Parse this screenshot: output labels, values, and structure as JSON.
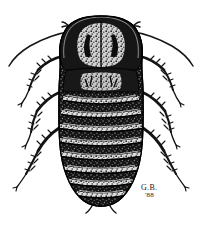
{
  "figure": {
    "kind": "scientific-illustration",
    "view": "dorsal",
    "medium": "black-and-white stipple / scratchboard pen drawing",
    "background_color": "#ffffff",
    "ink_color": "#111111",
    "canvas": {
      "width": 202,
      "height": 226
    }
  },
  "signature": {
    "initials": "G.B.",
    "year": "'88",
    "position": "lower-right",
    "color": "#1a1a1a"
  },
  "anatomy": {
    "parts": [
      {
        "name": "antenna-left",
        "label": "Left antenna"
      },
      {
        "name": "antenna-right",
        "label": "Right antenna"
      },
      {
        "name": "pronotum",
        "label": "Pronotum"
      },
      {
        "name": "mesonotum",
        "label": "Mesonotum"
      },
      {
        "name": "abdomen",
        "label": "Abdomen"
      },
      {
        "name": "leg-front-left",
        "label": "Front left leg"
      },
      {
        "name": "leg-front-right",
        "label": "Front right leg"
      },
      {
        "name": "leg-middle-left",
        "label": "Middle left leg"
      },
      {
        "name": "leg-middle-right",
        "label": "Middle right leg"
      },
      {
        "name": "leg-hind-left",
        "label": "Hind left leg"
      },
      {
        "name": "leg-hind-right",
        "label": "Hind right leg"
      },
      {
        "name": "cerci",
        "label": "Cerci"
      }
    ],
    "abdominal_segment_count": 8,
    "segment_bands": [
      {
        "index": 1,
        "y": 96,
        "half_width": 38,
        "sag": 7
      },
      {
        "index": 2,
        "y": 110,
        "half_width": 40,
        "sag": 7
      },
      {
        "index": 3,
        "y": 124,
        "half_width": 41,
        "sag": 7
      },
      {
        "index": 4,
        "y": 138,
        "half_width": 41,
        "sag": 7
      },
      {
        "index": 5,
        "y": 152,
        "half_width": 40,
        "sag": 7
      },
      {
        "index": 6,
        "y": 166,
        "half_width": 37,
        "sag": 6
      },
      {
        "index": 7,
        "y": 179,
        "half_width": 32,
        "sag": 6
      },
      {
        "index": 8,
        "y": 191,
        "half_width": 25,
        "sag": 5
      }
    ]
  }
}
